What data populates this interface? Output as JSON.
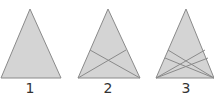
{
  "figure": {
    "fill_color": "#d4d4d4",
    "stroke_color": "#8a8a8a",
    "triangles": [
      {
        "label": "1",
        "apex": [
          30,
          9
        ],
        "base_left": [
          1,
          78
        ],
        "base_right": [
          61,
          78
        ],
        "cevians_per_corner": 0
      },
      {
        "label": "2",
        "apex": [
          108,
          9
        ],
        "base_left": [
          78,
          78
        ],
        "base_right": [
          140,
          78
        ],
        "cevians_per_corner": 1
      },
      {
        "label": "3",
        "apex": [
          186,
          9
        ],
        "base_left": [
          156,
          78
        ],
        "base_right": [
          214,
          78
        ],
        "cevians_per_corner": 2
      }
    ]
  }
}
